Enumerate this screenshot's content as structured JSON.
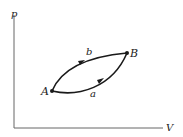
{
  "diagram": {
    "type": "pV-diagram",
    "axes": {
      "y_label": "p",
      "x_label": "V"
    },
    "points": [
      {
        "id": "A",
        "label": "A"
      },
      {
        "id": "B",
        "label": "B"
      }
    ],
    "paths": [
      {
        "id": "b",
        "label": "b",
        "from": "A",
        "to": "B",
        "position": "upper",
        "direction": "A-to-B"
      },
      {
        "id": "a",
        "label": "a",
        "from": "A",
        "to": "B",
        "position": "lower",
        "direction": "A-to-B"
      }
    ],
    "colors": {
      "stroke": "#1a1a1a",
      "axis": "#555555"
    }
  }
}
